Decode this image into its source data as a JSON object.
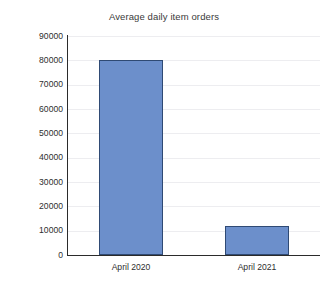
{
  "chart_data": {
    "type": "bar",
    "title": "Average daily item orders",
    "xlabel": "",
    "ylabel": "",
    "categories": [
      "April 2020",
      "April 2021"
    ],
    "values": [
      80000,
      12000
    ],
    "ylim": [
      0,
      90000
    ],
    "yticks": [
      0,
      10000,
      20000,
      30000,
      40000,
      50000,
      60000,
      70000,
      80000,
      90000
    ],
    "ytick_labels": [
      "0",
      "10000",
      "20000",
      "30000",
      "40000",
      "50000",
      "60000",
      "70000",
      "80000",
      "90000"
    ],
    "grid": true,
    "legend": false,
    "legend_position": "none",
    "series": [
      {
        "name": "Average daily item orders",
        "values": [
          80000,
          12000
        ],
        "color": "#6c8fcb",
        "border_color": "#2f4a74"
      }
    ]
  },
  "colors": {
    "bar_fill": "#6c8fcb",
    "bar_border": "#2f4a74",
    "axis": "#2b2b2b",
    "gridline": "#ededf0",
    "text": "#2e2e2e",
    "title_text": "#3a3a3a",
    "background": "#ffffff"
  }
}
